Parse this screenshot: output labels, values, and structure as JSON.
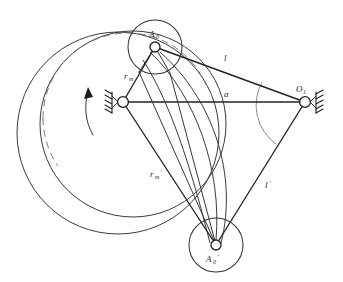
{
  "figure": {
    "background_color": "#ffffff",
    "line_color": "#2b2b2b",
    "dashed_arc_color": "#7a7a7a",
    "angle_arc_color": "#8d8d8d",
    "width": 343,
    "height": 282
  },
  "labels": {
    "top_joint": "A",
    "top_joint_sub": "0",
    "bottom_joint": "A",
    "bottom_joint_sub": "0",
    "bottom_joint_prime": "'",
    "right_pivot": "O",
    "right_pivot_sub": "1",
    "link_upper": "l",
    "link_lower": "l",
    "link_lower_prime": "'",
    "ground_link": "a",
    "radius": "r",
    "radius_sub": "m",
    "radius_primed": "r",
    "radius_primed_sub": "m",
    "radius_primed_prime": "'"
  },
  "nodes": {
    "crank_center": {
      "name": "left-ground-pivot",
      "x": 123,
      "y": 102,
      "radius": 5.4
    },
    "pin_top": {
      "name": "crank-pin-position-1",
      "x": 155,
      "y": 47,
      "radius": 5.0
    },
    "pin_bottom": {
      "name": "crank-pin-position-2",
      "x": 216,
      "y": 245,
      "radius": 5.0
    },
    "right_pivot": {
      "name": "right-ground-pivot",
      "x": 305,
      "y": 102,
      "radius": 5.4
    }
  },
  "wheels": [
    {
      "name": "cam-disc-position-1",
      "cx": 155,
      "cy": 47,
      "r": 27
    },
    {
      "name": "cam-disc-position-2",
      "cx": 216,
      "cy": 245,
      "r": 27
    }
  ],
  "loci": [
    {
      "name": "locus-circle-solid-outer",
      "cx": 118,
      "cy": 133,
      "r": 101,
      "style": "solid"
    },
    {
      "name": "locus-circle-solid-inner",
      "cx": 133,
      "cy": 124,
      "r": 93,
      "style": "solid"
    },
    {
      "name": "locus-circle-dashed",
      "cx": 128,
      "cy": 118,
      "r": 85,
      "style": "dashed"
    }
  ],
  "rotation_arrow": {
    "name": "counterclockwise-rotation-arrow",
    "direction": "counterclockwise",
    "tip_x": 88,
    "tip_y": 90
  },
  "angle_arc": {
    "name": "oscillation-angle-arc",
    "center_x": 305,
    "center_y": 102,
    "radius": 48
  },
  "links": [
    {
      "name": "link-l-upper",
      "from": "pin_top",
      "to": "right_pivot",
      "label": "l"
    },
    {
      "name": "link-l-lower",
      "from": "pin_bottom",
      "to": "right_pivot",
      "label": "l'"
    },
    {
      "name": "link-ground-a",
      "from": "crank_center",
      "to": "right_pivot",
      "label": "a"
    },
    {
      "name": "link-crank-r",
      "from": "crank_center",
      "to": "pin_top",
      "label": "rm"
    },
    {
      "name": "link-crank-r-prime",
      "from": "crank_center",
      "to": "pin_bottom",
      "label": "rm'"
    }
  ]
}
